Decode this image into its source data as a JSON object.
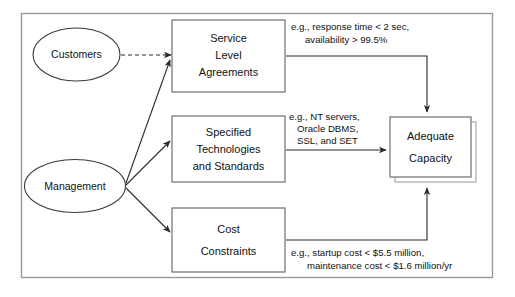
{
  "diagram": {
    "type": "block-flow-diagram",
    "background_color": "#ffffff",
    "frame_color": "#9a9a9a",
    "line_color": "#2b2b2b",
    "actors": [
      {
        "id": "customers",
        "label": "Customers",
        "shape": "ellipse"
      },
      {
        "id": "management",
        "label": "Management",
        "shape": "ellipse"
      }
    ],
    "requirement_boxes": [
      {
        "id": "sla",
        "shape": "rectangle",
        "lines": [
          "Service",
          "Level",
          "Agreements"
        ]
      },
      {
        "id": "technologies",
        "shape": "rectangle",
        "lines": [
          "Specified",
          "Technologies",
          "and Standards"
        ]
      },
      {
        "id": "cost",
        "shape": "rectangle",
        "lines": [
          "Cost",
          "Constraints"
        ]
      }
    ],
    "outcome_box": {
      "id": "adequate-capacity",
      "shape": "rectangle-stacked",
      "lines": [
        "Adequate",
        "Capacity"
      ]
    },
    "annotations": [
      {
        "id": "sla-examples",
        "lines": [
          "e.g., response time < 2 sec,",
          "availability > 99.5%"
        ]
      },
      {
        "id": "technology-examples",
        "lines": [
          "e.g., NT servers,",
          "Oracle DBMS,",
          "SSL, and SET"
        ]
      },
      {
        "id": "cost-examples",
        "lines": [
          "e.g., startup cost < $5.5 million,",
          "maintenance cost < $1.6 million/yr"
        ]
      }
    ],
    "connections": [
      {
        "id": "customers-to-sla",
        "from": "customers",
        "to": "sla",
        "style": "dashed",
        "arrow": true
      },
      {
        "id": "management-to-sla",
        "from": "management",
        "to": "sla",
        "style": "solid",
        "arrow": true
      },
      {
        "id": "management-to-technologies",
        "from": "management",
        "to": "technologies",
        "style": "solid",
        "arrow": true
      },
      {
        "id": "management-to-cost",
        "from": "management",
        "to": "cost",
        "style": "solid",
        "arrow": true
      },
      {
        "id": "sla-to-capacity",
        "from": "sla",
        "to": "adequate-capacity",
        "style": "solid-orthogonal",
        "arrow": true
      },
      {
        "id": "technologies-to-capacity",
        "from": "technologies",
        "to": "adequate-capacity",
        "style": "solid",
        "arrow": true
      },
      {
        "id": "cost-to-capacity",
        "from": "cost",
        "to": "adequate-capacity",
        "style": "solid-orthogonal",
        "arrow": true
      }
    ]
  }
}
